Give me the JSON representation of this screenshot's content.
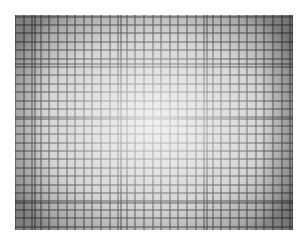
{
  "image": {
    "subject": "Photograph of a square grid pattern showing lens distortion and vignetting",
    "alt": "Grayscale photograph of a fine square grid with bright center and darker edges",
    "colors": {
      "background": "#ffffff",
      "grid_line": "#5a5a5a",
      "center_tone": "#f2f2f2",
      "edge_tone": "#8a8a8a"
    },
    "grid": {
      "fine_spacing_px": 8.5,
      "bold_every_n_cells": 10
    }
  }
}
